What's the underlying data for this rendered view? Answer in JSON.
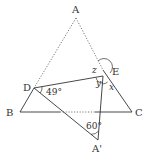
{
  "diagram": {
    "points": {
      "A": {
        "label": "A",
        "x": 76,
        "y": 18
      },
      "B": {
        "label": "B",
        "x": 20,
        "y": 112
      },
      "C": {
        "label": "C",
        "x": 132,
        "y": 112
      },
      "D": {
        "label": "D",
        "x": 34,
        "y": 88
      },
      "E": {
        "label": "E",
        "x": 103,
        "y": 70
      },
      "A_prime": {
        "label": "A'",
        "x": 98,
        "y": 140
      }
    },
    "angles": {
      "angle_D": "49°",
      "angle_A_prime": "60°",
      "x": "x",
      "y": "y",
      "z": "z"
    },
    "colors": {
      "line": "#333333",
      "dotted": "#555555"
    }
  }
}
